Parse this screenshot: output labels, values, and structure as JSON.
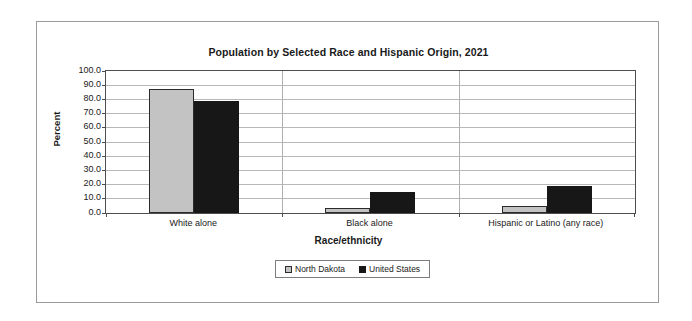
{
  "chart_data": {
    "type": "bar",
    "title": "Population by Selected Race and Hispanic Origin, 2021",
    "xlabel": "Race/ethnicity",
    "ylabel": "Percent",
    "categories": [
      "White alone",
      "Black alone",
      "Hispanic or Latino (any race)"
    ],
    "series": [
      {
        "name": "North Dakota",
        "color": "#c3c3c3",
        "values": [
          86.8,
          3.3,
          4.5
        ]
      },
      {
        "name": "United States",
        "color": "#171717",
        "values": [
          78.5,
          14.2,
          19.0
        ]
      }
    ],
    "ylim": [
      0,
      100
    ],
    "ytick_labels": [
      "100.0",
      "90.0",
      "80.0",
      "70.0",
      "60.0",
      "50.0",
      "40.0",
      "30.0",
      "20.0",
      "10.0",
      "0.0"
    ],
    "ytick_values": [
      100,
      90,
      80,
      70,
      60,
      50,
      40,
      30,
      20,
      10,
      0
    ],
    "grid": true,
    "legend_position": "bottom-center"
  }
}
